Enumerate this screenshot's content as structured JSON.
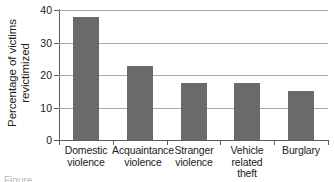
{
  "chart_data": {
    "type": "bar",
    "title": "",
    "subtitle": "",
    "xlabel": "",
    "ylabel": "Percentage of victims revictimized",
    "ylabel_lines": [
      "Percentage of victims",
      "revictimized"
    ],
    "categories": [
      "Domestic violence",
      "Acquaintance violence",
      "Stranger violence",
      "Vehicle related theft",
      "Burglary"
    ],
    "category_label_lines": [
      [
        "Domestic",
        "violence"
      ],
      [
        "Acquaintance",
        "violence"
      ],
      [
        "Stranger",
        "violence"
      ],
      [
        "Vehicle",
        "related",
        "theft"
      ],
      [
        "Burglary"
      ]
    ],
    "values": [
      37.8,
      22.8,
      17.5,
      17.4,
      15.2
    ],
    "ylim": [
      0,
      40
    ],
    "yticks": [
      0,
      10,
      20,
      30,
      40
    ],
    "ytick_labels": [
      "0",
      "10",
      "20",
      "30",
      "40"
    ],
    "grid": true,
    "grid_axis": "y",
    "legend": false,
    "bar_color": "#6a6a6a",
    "gridline_color": "#a8a8a8",
    "axis_color": "#5d5d5d",
    "background_color": "#ffffff"
  },
  "caption": {
    "text": "Figure  ..."
  }
}
